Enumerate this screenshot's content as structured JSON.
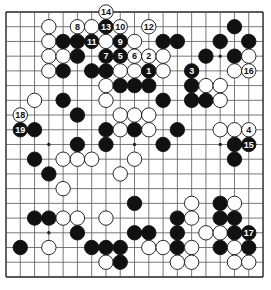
{
  "board": {
    "size": 19,
    "origin_x": 6,
    "origin_y": 12,
    "step_x": 14.28,
    "step_y": 14.72,
    "stone_radius": 7.2,
    "line_color": "#555555",
    "border_color": "#222222",
    "black_color": "#111111",
    "white_color": "#ffffff",
    "star_points": [
      [
        3,
        3
      ],
      [
        9,
        3
      ],
      [
        15,
        3
      ],
      [
        3,
        9
      ],
      [
        9,
        9
      ],
      [
        15,
        9
      ],
      [
        3,
        15
      ],
      [
        9,
        15
      ],
      [
        15,
        15
      ]
    ]
  },
  "stones": [
    {
      "c": 7,
      "r": 0,
      "color": "W",
      "label": "14"
    },
    {
      "c": 3,
      "r": 1,
      "color": "W"
    },
    {
      "c": 5,
      "r": 1,
      "color": "W",
      "label": "8"
    },
    {
      "c": 6,
      "r": 1,
      "color": "W"
    },
    {
      "c": 7,
      "r": 1,
      "color": "B",
      "label": "13"
    },
    {
      "c": 8,
      "r": 1,
      "color": "W",
      "label": "10"
    },
    {
      "c": 10,
      "r": 1,
      "color": "W",
      "label": "12"
    },
    {
      "c": 16,
      "r": 1,
      "color": "B"
    },
    {
      "c": 3,
      "r": 2,
      "color": "W"
    },
    {
      "c": 4,
      "r": 2,
      "color": "B"
    },
    {
      "c": 5,
      "r": 2,
      "color": "B"
    },
    {
      "c": 6,
      "r": 2,
      "color": "B",
      "label": "11"
    },
    {
      "c": 7,
      "r": 2,
      "color": "W"
    },
    {
      "c": 8,
      "r": 2,
      "color": "B",
      "label": "9"
    },
    {
      "c": 9,
      "r": 2,
      "color": "W"
    },
    {
      "c": 11,
      "r": 2,
      "color": "B"
    },
    {
      "c": 12,
      "r": 2,
      "color": "B"
    },
    {
      "c": 15,
      "r": 2,
      "color": "B"
    },
    {
      "c": 17,
      "r": 2,
      "color": "B"
    },
    {
      "c": 3,
      "r": 3,
      "color": "W"
    },
    {
      "c": 4,
      "r": 3,
      "color": "W"
    },
    {
      "c": 5,
      "r": 3,
      "color": "B"
    },
    {
      "c": 7,
      "r": 3,
      "color": "B",
      "label": "7"
    },
    {
      "c": 8,
      "r": 3,
      "color": "B",
      "label": "5"
    },
    {
      "c": 9,
      "r": 3,
      "color": "W",
      "label": "6"
    },
    {
      "c": 10,
      "r": 3,
      "color": "W",
      "label": "2"
    },
    {
      "c": 11,
      "r": 3,
      "color": "W"
    },
    {
      "c": 14,
      "r": 3,
      "color": "B"
    },
    {
      "c": 16,
      "r": 3,
      "color": "B"
    },
    {
      "c": 17,
      "r": 3,
      "color": "W"
    },
    {
      "c": 3,
      "r": 4,
      "color": "W"
    },
    {
      "c": 4,
      "r": 4,
      "color": "B"
    },
    {
      "c": 6,
      "r": 4,
      "color": "B"
    },
    {
      "c": 7,
      "r": 4,
      "color": "B"
    },
    {
      "c": 8,
      "r": 4,
      "color": "W"
    },
    {
      "c": 9,
      "r": 4,
      "color": "W"
    },
    {
      "c": 10,
      "r": 4,
      "color": "B",
      "label": "1"
    },
    {
      "c": 11,
      "r": 4,
      "color": "W"
    },
    {
      "c": 13,
      "r": 4,
      "color": "B",
      "label": "3"
    },
    {
      "c": 16,
      "r": 4,
      "color": "W"
    },
    {
      "c": 17,
      "r": 4,
      "color": "W",
      "label": "16"
    },
    {
      "c": 7,
      "r": 5,
      "color": "W"
    },
    {
      "c": 8,
      "r": 5,
      "color": "B"
    },
    {
      "c": 9,
      "r": 5,
      "color": "B"
    },
    {
      "c": 10,
      "r": 5,
      "color": "B"
    },
    {
      "c": 13,
      "r": 5,
      "color": "B"
    },
    {
      "c": 14,
      "r": 5,
      "color": "W"
    },
    {
      "c": 15,
      "r": 5,
      "color": "W"
    },
    {
      "c": 2,
      "r": 6,
      "color": "W"
    },
    {
      "c": 4,
      "r": 6,
      "color": "B"
    },
    {
      "c": 7,
      "r": 6,
      "color": "W"
    },
    {
      "c": 11,
      "r": 6,
      "color": "B"
    },
    {
      "c": 13,
      "r": 6,
      "color": "B"
    },
    {
      "c": 14,
      "r": 6,
      "color": "B"
    },
    {
      "c": 15,
      "r": 6,
      "color": "W"
    },
    {
      "c": 1,
      "r": 7,
      "color": "W",
      "label": "18"
    },
    {
      "c": 5,
      "r": 7,
      "color": "B"
    },
    {
      "c": 8,
      "r": 7,
      "color": "W"
    },
    {
      "c": 9,
      "r": 7,
      "color": "W"
    },
    {
      "c": 10,
      "r": 7,
      "color": "W"
    },
    {
      "c": 1,
      "r": 8,
      "color": "B",
      "label": "19"
    },
    {
      "c": 2,
      "r": 8,
      "color": "B"
    },
    {
      "c": 7,
      "r": 8,
      "color": "B"
    },
    {
      "c": 8,
      "r": 8,
      "color": "W"
    },
    {
      "c": 9,
      "r": 8,
      "color": "B"
    },
    {
      "c": 10,
      "r": 8,
      "color": "W"
    },
    {
      "c": 12,
      "r": 8,
      "color": "B"
    },
    {
      "c": 15,
      "r": 8,
      "color": "W"
    },
    {
      "c": 16,
      "r": 8,
      "color": "W"
    },
    {
      "c": 17,
      "r": 8,
      "color": "W",
      "label": "4"
    },
    {
      "c": 5,
      "r": 9,
      "color": "B"
    },
    {
      "c": 7,
      "r": 9,
      "color": "B"
    },
    {
      "c": 11,
      "r": 9,
      "color": "B"
    },
    {
      "c": 16,
      "r": 9,
      "color": "B"
    },
    {
      "c": 17,
      "r": 9,
      "color": "B",
      "label": "15"
    },
    {
      "c": 2,
      "r": 10,
      "color": "B"
    },
    {
      "c": 4,
      "r": 10,
      "color": "W"
    },
    {
      "c": 5,
      "r": 10,
      "color": "W"
    },
    {
      "c": 6,
      "r": 10,
      "color": "W"
    },
    {
      "c": 9,
      "r": 10,
      "color": "W"
    },
    {
      "c": 16,
      "r": 10,
      "color": "B"
    },
    {
      "c": 3,
      "r": 11,
      "color": "B"
    },
    {
      "c": 8,
      "r": 11,
      "color": "W"
    },
    {
      "c": 4,
      "r": 12,
      "color": "W"
    },
    {
      "c": 9,
      "r": 13,
      "color": "B"
    },
    {
      "c": 13,
      "r": 13,
      "color": "W"
    },
    {
      "c": 15,
      "r": 13,
      "color": "B"
    },
    {
      "c": 16,
      "r": 13,
      "color": "W"
    },
    {
      "c": 2,
      "r": 14,
      "color": "B"
    },
    {
      "c": 3,
      "r": 14,
      "color": "B"
    },
    {
      "c": 4,
      "r": 14,
      "color": "W"
    },
    {
      "c": 5,
      "r": 14,
      "color": "W"
    },
    {
      "c": 7,
      "r": 14,
      "color": "W"
    },
    {
      "c": 12,
      "r": 14,
      "color": "B"
    },
    {
      "c": 13,
      "r": 14,
      "color": "W"
    },
    {
      "c": 15,
      "r": 14,
      "color": "B"
    },
    {
      "c": 16,
      "r": 14,
      "color": "B"
    },
    {
      "c": 5,
      "r": 15,
      "color": "B"
    },
    {
      "c": 9,
      "r": 15,
      "color": "B"
    },
    {
      "c": 10,
      "r": 15,
      "color": "B"
    },
    {
      "c": 12,
      "r": 15,
      "color": "B"
    },
    {
      "c": 14,
      "r": 15,
      "color": "W"
    },
    {
      "c": 15,
      "r": 15,
      "color": "W"
    },
    {
      "c": 16,
      "r": 15,
      "color": "B"
    },
    {
      "c": 17,
      "r": 15,
      "color": "B",
      "label": "17"
    },
    {
      "c": 1,
      "r": 16,
      "color": "B"
    },
    {
      "c": 3,
      "r": 16,
      "color": "W"
    },
    {
      "c": 6,
      "r": 16,
      "color": "B"
    },
    {
      "c": 7,
      "r": 16,
      "color": "B"
    },
    {
      "c": 8,
      "r": 16,
      "color": "B"
    },
    {
      "c": 10,
      "r": 16,
      "color": "W"
    },
    {
      "c": 11,
      "r": 16,
      "color": "W"
    },
    {
      "c": 12,
      "r": 16,
      "color": "B"
    },
    {
      "c": 13,
      "r": 16,
      "color": "W"
    },
    {
      "c": 15,
      "r": 16,
      "color": "B"
    },
    {
      "c": 16,
      "r": 16,
      "color": "W"
    },
    {
      "c": 17,
      "r": 16,
      "color": "B"
    },
    {
      "c": 7,
      "r": 17,
      "color": "W"
    },
    {
      "c": 8,
      "r": 17,
      "color": "B"
    },
    {
      "c": 12,
      "r": 17,
      "color": "W"
    },
    {
      "c": 13,
      "r": 17,
      "color": "W"
    },
    {
      "c": 16,
      "r": 17,
      "color": "W"
    },
    {
      "c": 17,
      "r": 17,
      "color": "W"
    }
  ]
}
